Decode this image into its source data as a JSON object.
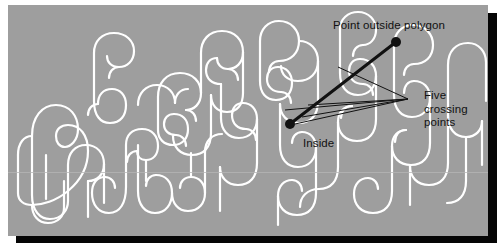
{
  "figure": {
    "type": "diagram",
    "background_color": "#9e9e9e",
    "curve_color": "#ffffff",
    "ink_color": "#111111",
    "shadow_color": "#050505",
    "page_color": "#ffffff"
  },
  "labels": {
    "point_outside": "Point outside polygon",
    "inside": "Inside",
    "five_crossing_points": "Five\ncrossing\npoints"
  },
  "markers": {
    "outside_point": {
      "x": 388,
      "y": 37,
      "r": 5
    },
    "inside_point": {
      "x": 282,
      "y": 119,
      "r": 5
    }
  },
  "ray": {
    "from": {
      "x": 282,
      "y": 119
    },
    "to": {
      "x": 388,
      "y": 37
    },
    "width": 3
  },
  "leaders": {
    "hub": {
      "x": 400,
      "y": 94
    },
    "targets": [
      {
        "x": 294,
        "y": 112
      },
      {
        "x": 287,
        "y": 119
      },
      {
        "x": 277,
        "y": 105
      },
      {
        "x": 300,
        "y": 100
      },
      {
        "x": 330,
        "y": 62
      }
    ],
    "width": 1
  }
}
